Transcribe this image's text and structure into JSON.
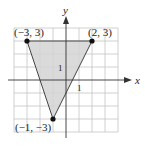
{
  "diagram": {
    "type": "coordinate-plane-triangle",
    "axes": {
      "x_label": "x",
      "y_label": "y",
      "tick_label_x": "1",
      "tick_label_y": "1"
    },
    "grid": {
      "x_min": -4,
      "x_max": 4,
      "y_min": -4,
      "y_max": 4,
      "unit": 1
    },
    "vertices": [
      {
        "x": -3,
        "y": 3,
        "label": "(−3, 3)"
      },
      {
        "x": 2,
        "y": 3,
        "label": "(2, 3)"
      },
      {
        "x": -1,
        "y": -3,
        "label": "(−1, −3)"
      }
    ],
    "colors": {
      "fill": "#d6d6d6",
      "grid": "#bdbdbd",
      "edge": "#444444",
      "point": "#111111",
      "axis": "#333333"
    }
  }
}
